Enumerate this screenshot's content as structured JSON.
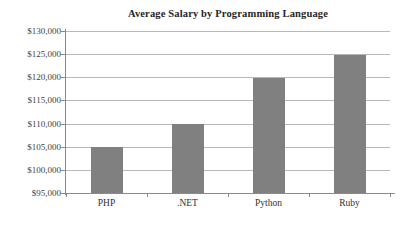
{
  "chart_data": {
    "type": "bar",
    "title": "Average Salary by Programming Language",
    "xlabel": "",
    "ylabel": "",
    "categories": [
      "PHP",
      ".NET",
      "Python",
      "Ruby"
    ],
    "values": [
      105000,
      109900,
      119800,
      124800
    ],
    "ylim": [
      95000,
      130000
    ],
    "ytick_step": 5000,
    "ytick_labels": [
      "$130,000",
      "$125,000",
      "$120,000",
      "$115,000",
      "$110,000",
      "$105,000",
      "$100,000",
      "$95,000"
    ],
    "ytick_values": [
      130000,
      125000,
      120000,
      115000,
      110000,
      105000,
      100000,
      95000
    ],
    "grid": true,
    "legend": false,
    "legend_position": "none",
    "bar_color": "#808080",
    "gridline_color": "#b9b9b9",
    "axis_color": "#8a8a8a",
    "background_color": "#ffffff",
    "text_color": "#3a3a3a"
  }
}
